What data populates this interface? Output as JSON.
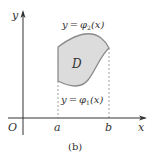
{
  "figure": {
    "caption": "(b)",
    "origin_label": "O",
    "x_axis_label": "x",
    "y_axis_label": "y",
    "region_label": "D",
    "tick_a": "a",
    "tick_b": "b",
    "upper_curve_label": {
      "y": "y",
      "eq": "=",
      "phi": "φ",
      "sub": "2",
      "arg": "(x)"
    },
    "lower_curve_label": {
      "y": "y",
      "eq": "=",
      "phi": "φ",
      "sub": "1",
      "arg": "(x)"
    },
    "colors": {
      "region_fill": "#dcdcdc",
      "region_stroke": "#8a8a8a",
      "axis": "#333333",
      "dashed": "#888888"
    }
  }
}
